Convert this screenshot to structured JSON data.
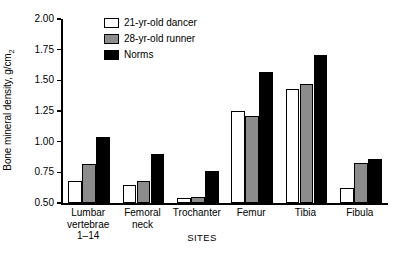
{
  "chart_data": {
    "type": "bar",
    "title": "",
    "xlabel": "SITES",
    "ylabel": "Bone mineral density, g/cm",
    "ylabel_subscript": "2",
    "ylim": [
      0.5,
      2.0
    ],
    "yticks": [
      0.5,
      0.75,
      1.0,
      1.25,
      1.5,
      1.75,
      2.0
    ],
    "ytick_labels": [
      "0.50",
      "0.75",
      "1.00",
      "1.25",
      "1.50",
      "1.75",
      "2.00"
    ],
    "grid": false,
    "legend_position": "top-center",
    "categories": [
      "Lumbar\nvertebrae\n1–14",
      "Femoral\nneck",
      "Trochanter",
      "Femur",
      "Tibia",
      "Fibula"
    ],
    "category_labels_flat": [
      "Lumbar vertebrae 1–14",
      "Femoral neck",
      "Trochanter",
      "Femur",
      "Tibia",
      "Fibula"
    ],
    "series": [
      {
        "name": "21-yr-old dancer",
        "color": "#ffffff",
        "values": [
          0.68,
          0.65,
          0.54,
          1.25,
          1.43,
          0.62
        ]
      },
      {
        "name": "28-yr-old runner",
        "color": "#8c8c8c",
        "values": [
          0.82,
          0.68,
          0.55,
          1.21,
          1.47,
          0.83
        ]
      },
      {
        "name": "Norms",
        "color": "#000000",
        "values": [
          1.04,
          0.9,
          0.76,
          1.57,
          1.71,
          0.86
        ]
      }
    ]
  },
  "legend": {
    "items": [
      {
        "label": "21-yr-old dancer",
        "swatch": "dancer"
      },
      {
        "label": "28-yr-old runner",
        "swatch": "runner"
      },
      {
        "label": "Norms",
        "swatch": "norms"
      }
    ]
  },
  "axes": {
    "y_label_text": "Bone mineral density, g/cm",
    "y_label_sub": "2",
    "x_label_text": "SITES"
  }
}
